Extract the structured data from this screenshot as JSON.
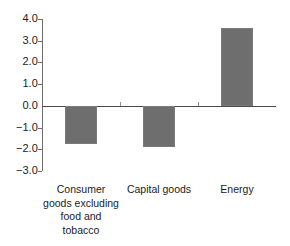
{
  "chart_data": {
    "type": "bar",
    "title": "",
    "subtitle": "",
    "xlabel": "",
    "ylabel": "",
    "categories": [
      "Consumer goods excluding food and tobacco",
      "Capital goods",
      "Energy"
    ],
    "category_label_lines": [
      [
        "Consumer",
        "goods excluding",
        "food and",
        "tobacco"
      ],
      [
        "Capital goods"
      ],
      [
        "Energy"
      ]
    ],
    "values": [
      -1.75,
      -1.9,
      3.6
    ],
    "ylim": [
      -3.0,
      4.0
    ],
    "ytick_step": 1.0,
    "yticks": [
      4.0,
      3.0,
      2.0,
      1.0,
      0.0,
      -1.0,
      -2.0,
      -3.0
    ],
    "ytick_labels": [
      "4.0",
      "3.0",
      "2.0",
      "1.0",
      "0.0",
      "-1.0",
      "-2.0",
      "-3.0"
    ],
    "grid": false,
    "legend": false,
    "legend_position": "none",
    "bar_color": "#6e6e6e",
    "axis_color": "#6d6d6d",
    "baseline_color": "#4a4a4a",
    "text_color": "#1c1c1c",
    "background_color": "#ffffff"
  }
}
